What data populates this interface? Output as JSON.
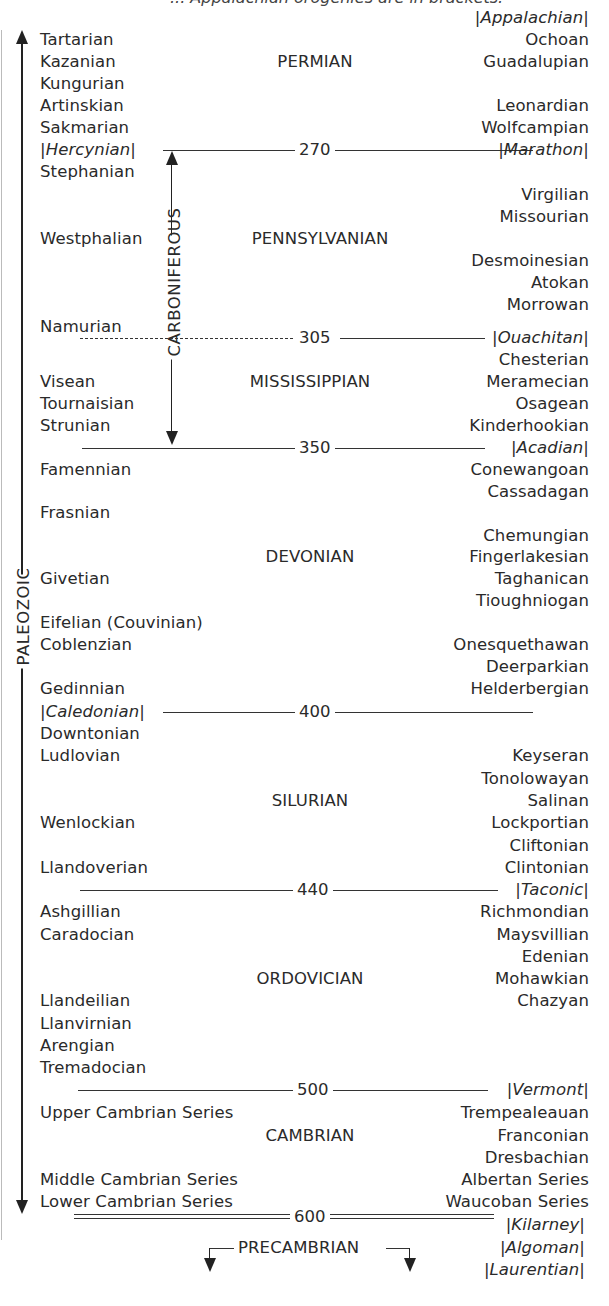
{
  "caption_fragment": "... Appalachian orogenies are in brackets.",
  "era_label": "PALEOZOIC",
  "carboniferous_label": "CARBONIFEROUS",
  "precambrian_label": "PRECAMBRIAN",
  "boundaries": [
    {
      "age": "270",
      "left": "|Hercynian|",
      "right": "|Marathon|",
      "style": "solid"
    },
    {
      "age": "305",
      "left": "",
      "right": "|Ouachitan|",
      "style": "dashed-left"
    },
    {
      "age": "350",
      "left": "",
      "right": "|Acadian|",
      "style": "solid"
    },
    {
      "age": "400",
      "left": "|Caledonian|",
      "right": "",
      "style": "solid"
    },
    {
      "age": "440",
      "left": "",
      "right": "|Taconic|",
      "style": "solid"
    },
    {
      "age": "500",
      "left": "",
      "right": "|Vermont|",
      "style": "solid"
    },
    {
      "age": "600",
      "left": "",
      "right": "",
      "style": "double"
    }
  ],
  "periods": {
    "permian": "PERMIAN",
    "pennsylvanian": "PENNSYLVANIAN",
    "mississippian": "MISSISSIPPIAN",
    "devonian": "DEVONIAN",
    "silurian": "SILURIAN",
    "ordovician": "ORDOVICIAN",
    "cambrian": "CAMBRIAN"
  },
  "european_stages": {
    "tartarian": "Tartarian",
    "kazanian": "Kazanian",
    "kungurian": "Kungurian",
    "artinskian": "Artinskian",
    "sakmarian": "Sakmarian",
    "stephanian": "Stephanian",
    "westphalian": "Westphalian",
    "namurian": "Namurian",
    "visean": "Visean",
    "tournaisian": "Tournaisian",
    "strunian": "Strunian",
    "famennian": "Famennian",
    "frasnian": "Frasnian",
    "givetian": "Givetian",
    "eifelian": "Eifelian (Couvinian)",
    "coblenzian": "Coblenzian",
    "gedinnian": "Gedinnian",
    "downtonian": "Downtonian",
    "ludlovian": "Ludlovian",
    "wenlockian": "Wenlockian",
    "llandoverian": "Llandoverian",
    "ashgillian": "Ashgillian",
    "caradocian": "Caradocian",
    "llandeilian": "Llandeilian",
    "llanvirnian": "Llanvirnian",
    "arengian": "Arengian",
    "tremadocian": "Tremadocian",
    "upper_cambrian": "Upper Cambrian Series",
    "middle_cambrian": "Middle Cambrian Series",
    "lower_cambrian": "Lower Cambrian Series"
  },
  "american_stages": {
    "appalachian": "|Appalachian|",
    "ochoan": "Ochoan",
    "guadalupian": "Guadalupian",
    "leonardian": "Leonardian",
    "wolfcampian": "Wolfcampian",
    "virgilian": "Virgilian",
    "missourian": "Missourian",
    "desmoinesian": "Desmoinesian",
    "atokan": "Atokan",
    "morrowan": "Morrowan",
    "chesterian": "Chesterian",
    "meramecian": "Meramecian",
    "osagean": "Osagean",
    "kinderhookian": "Kinderhookian",
    "conewangoan": "Conewangoan",
    "cassadagan": "Cassadagan",
    "chemungian": "Chemungian",
    "fingerlakesian": "Fingerlakesian",
    "taghanican": "Taghanican",
    "tioughniogan": "Tioughniogan",
    "onesquethawan": "Onesquethawan",
    "deerparkian": "Deerparkian",
    "helderbergian": "Helderbergian",
    "keyseran": "Keyseran",
    "tonolowayan": "Tonolowayan",
    "salinan": "Salinan",
    "lockportian": "Lockportian",
    "cliftonian": "Cliftonian",
    "clintonian": "Clintonian",
    "richmondian": "Richmondian",
    "maysvillian": "Maysvillian",
    "edenian": "Edenian",
    "mohawkian": "Mohawkian",
    "chazyan": "Chazyan",
    "trempealeauan": "Trempealeauan",
    "franconian": "Franconian",
    "dresbachian": "Dresbachian",
    "albertan": "Albertan Series",
    "waucoban": "Waucoban Series",
    "kilarney": "|Kilarney|",
    "algoman": "|Algoman|",
    "laurentian": "|Laurentian|"
  }
}
